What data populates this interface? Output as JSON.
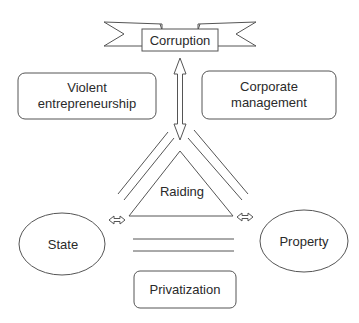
{
  "diagram": {
    "banner": {
      "label": "Corruption"
    },
    "boxes": {
      "violent": {
        "line1": "Violent",
        "line2": "entrepreneurship"
      },
      "corporate": {
        "line1": "Corporate",
        "line2": "management"
      },
      "privatization": {
        "label": "Privatization"
      }
    },
    "triangle": {
      "label": "Raiding"
    },
    "ellipses": {
      "state": {
        "label": "State"
      },
      "property": {
        "label": "Property"
      }
    },
    "colors": {
      "stroke": "#555555",
      "text": "#2a2a2a",
      "background": "#ffffff"
    }
  }
}
